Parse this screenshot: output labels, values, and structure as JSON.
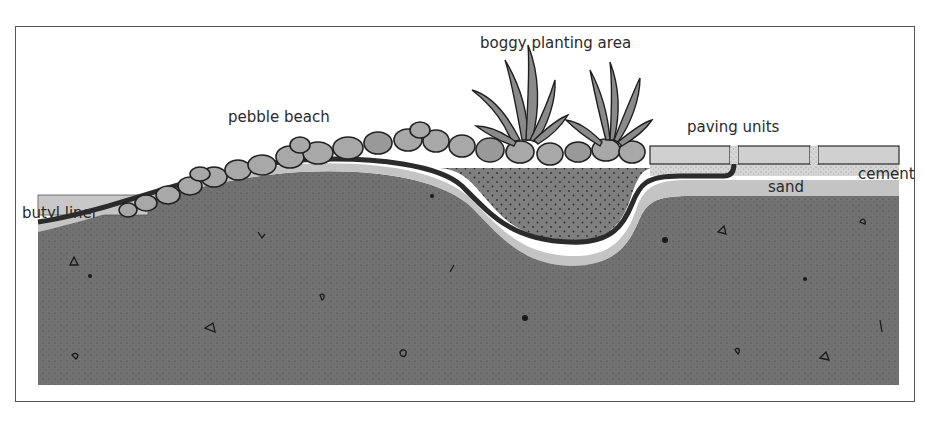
{
  "diagram": {
    "labels": {
      "boggy_planting_area": "boggy planting area",
      "pebble_beach": "pebble beach",
      "paving_units": "paving units",
      "cement": "cement",
      "sand": "sand",
      "butyl_liner": "butyl liner"
    },
    "layers": [
      {
        "name": "pebbles",
        "color": "#a9a9a9"
      },
      {
        "name": "butyl liner",
        "color": "#2e2e2e"
      },
      {
        "name": "sand",
        "color": "#c4c4c4"
      },
      {
        "name": "cement",
        "color": "#d8d8d8"
      },
      {
        "name": "paving units",
        "color": "#cfcfcf"
      },
      {
        "name": "bog soil",
        "color": "#7c7c7c"
      },
      {
        "name": "subsoil",
        "color": "#6e6e6e"
      }
    ]
  }
}
